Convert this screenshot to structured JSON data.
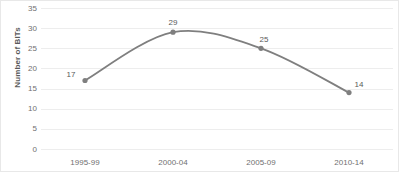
{
  "chart_data": {
    "type": "line",
    "title": "",
    "xlabel": "",
    "ylabel": "Number of BITs",
    "categories": [
      "1995-99",
      "2000-04",
      "2005-09",
      "2010-14"
    ],
    "values": [
      17,
      29,
      25,
      14
    ],
    "data_labels": [
      "17",
      "29",
      "25",
      "14"
    ],
    "ylim": [
      0,
      35
    ],
    "ytick_labels": [
      "35",
      "30",
      "25",
      "20",
      "15",
      "10",
      "5",
      "0"
    ],
    "ytick_values": [
      35,
      30,
      25,
      20,
      15,
      10,
      5,
      0
    ],
    "ytick_step": 5,
    "grid": true,
    "grid_axis": "y",
    "legend": "none",
    "smoothing": true,
    "series": [
      {
        "name": "Number of BITs",
        "values": [
          17,
          29,
          25,
          14
        ],
        "line_color": "#7f7f7f",
        "marker": "circle",
        "marker_color": "#7f7f7f"
      }
    ],
    "colors": {
      "line": "#7f7f7f",
      "marker": "#7f7f7f",
      "gridline": "#ededed",
      "tick_text": "#707070",
      "label_text": "#595959",
      "background": "#ffffff",
      "border": "#e8e8e8"
    }
  }
}
